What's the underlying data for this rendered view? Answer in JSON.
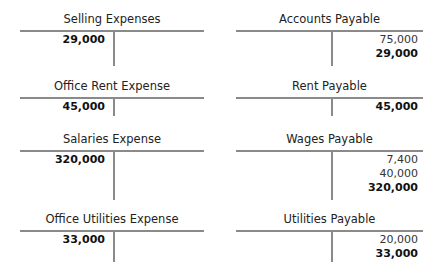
{
  "left_column": [
    {
      "title": "Selling Expenses",
      "debits": [
        {
          "value": "29,000",
          "bold": true
        }
      ],
      "credits": []
    },
    {
      "title": "Office Rent Expense",
      "debits": [
        {
          "value": "45,000",
          "bold": true
        }
      ],
      "credits": []
    },
    {
      "title": "Salaries Expense",
      "debits": [
        {
          "value": "320,000",
          "bold": true
        }
      ],
      "credits": []
    },
    {
      "title": "Office Utilities Expense",
      "debits": [
        {
          "value": "33,000",
          "bold": true
        }
      ],
      "credits": []
    }
  ],
  "right_column": [
    {
      "title": "Accounts Payable",
      "debits": [],
      "credits": [
        {
          "value": "75,000",
          "bold": false
        },
        {
          "value": "29,000",
          "bold": true
        }
      ]
    },
    {
      "title": "Rent Payable",
      "debits": [],
      "credits": [
        {
          "value": "45,000",
          "bold": true
        }
      ]
    },
    {
      "title": "Wages Payable",
      "debits": [],
      "credits": [
        {
          "value": "7,400",
          "bold": false
        },
        {
          "value": "40,000",
          "bold": false
        },
        {
          "value": "320,000",
          "bold": true
        }
      ]
    },
    {
      "title": "Utilities Payable",
      "debits": [],
      "credits": [
        {
          "value": "20,000",
          "bold": false
        },
        {
          "value": "33,000",
          "bold": true
        }
      ]
    }
  ]
}
